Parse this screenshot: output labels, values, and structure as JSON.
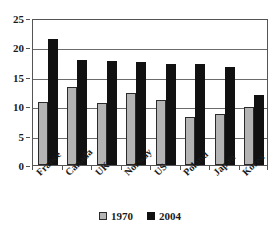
{
  "chart_data": {
    "type": "bar",
    "title": "",
    "subtitle": "",
    "xlabel": "",
    "ylabel": "",
    "categories": [
      "France",
      "Canada",
      "UK",
      "Norway",
      "US",
      "Poland",
      "Japan",
      "Korea"
    ],
    "series": [
      {
        "name": "1970",
        "color": "#b4b4b4",
        "values": [
          10.8,
          13.2,
          10.6,
          12.3,
          11.1,
          8.1,
          8.7,
          9.8
        ]
      },
      {
        "name": "2004",
        "color": "#111111",
        "values": [
          21.4,
          17.9,
          17.7,
          17.5,
          17.2,
          17.1,
          16.7,
          11.9
        ]
      }
    ],
    "ylim": [
      0,
      25
    ],
    "yticks": [
      0,
      5,
      10,
      15,
      20,
      25
    ],
    "ytick_labels": [
      "0",
      "5",
      "10",
      "15",
      "20",
      "25"
    ],
    "grid": true,
    "grid_axis": "y",
    "legend_position": "bottom",
    "legend_entries": [
      "1970",
      "2004"
    ]
  }
}
